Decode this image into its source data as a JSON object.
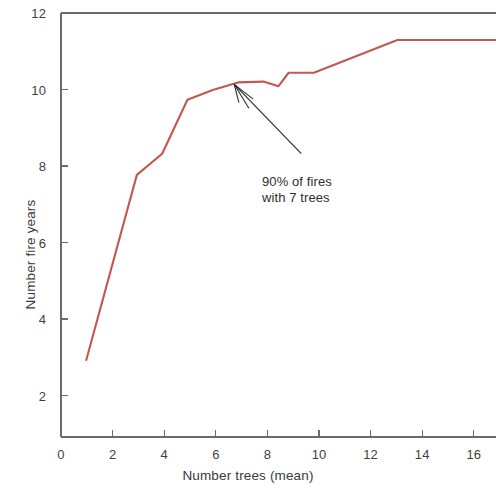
{
  "chart_data": {
    "type": "line",
    "title": "",
    "xlabel": "Number trees (mean)",
    "ylabel": "Number fire years",
    "xlim": [
      0,
      17.2
    ],
    "ylim": [
      1.0,
      12.0
    ],
    "xticks": [
      0,
      2,
      4,
      6,
      8,
      10,
      12,
      14,
      16
    ],
    "xtick_labels": [
      "0",
      "2",
      "4",
      "6",
      "8",
      "10",
      "12",
      "14",
      "16"
    ],
    "yticks": [
      2,
      4,
      6,
      8,
      10,
      12
    ],
    "ytick_labels": [
      "2",
      "4",
      "6",
      "8",
      "10",
      "12"
    ],
    "grid": false,
    "legend": null,
    "line_color": "#c4574f",
    "axis_color": "#6b6b6b",
    "series": [
      {
        "name": "Number fire years",
        "color": "#c4574f",
        "x": [
          1.0,
          3.0,
          4.0,
          5.0,
          6.0,
          7.0,
          8.0,
          8.6,
          9.0,
          10.0,
          13.3,
          17.2
        ],
        "y": [
          3.0,
          7.8,
          8.35,
          9.75,
          10.0,
          10.2,
          10.22,
          10.1,
          10.45,
          10.45,
          11.3,
          11.3
        ]
      }
    ],
    "annotations": [
      {
        "name": "ninety-percent-callout",
        "line1": "90% of fires",
        "line2": "with 7 trees",
        "arrow_from_x": 9.5,
        "arrow_from_y": 8.35,
        "arrow_to_x": 6.85,
        "arrow_to_y": 10.15
      }
    ]
  }
}
